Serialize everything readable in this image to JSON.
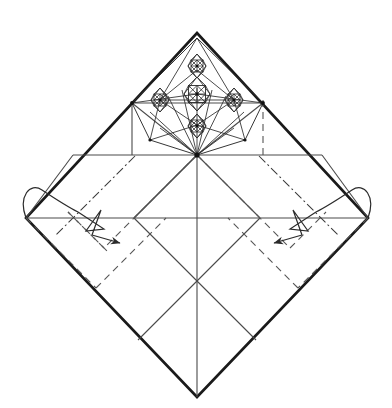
{
  "figure": {
    "kind": "origami-crease-pattern",
    "paper_shape": "square rotated 45 degrees (diamond)",
    "width": 392,
    "height": 408,
    "background_color": "#ffffff"
  },
  "colors": {
    "paper_edge": "#1a1a1a",
    "mountain_solid": "#4a4a4a",
    "valley_dashed": "#555555",
    "dash_dot": "#3a3a3a",
    "molecule_line": "#2b2b2b",
    "arrow": "#2b2b2b",
    "node_dot": "#111111"
  },
  "geometry": {
    "diamond": {
      "top": [
        197,
        33
      ],
      "right": [
        368,
        218
      ],
      "bottom": [
        197,
        397
      ],
      "left": [
        26,
        218
      ]
    },
    "center": [
      197,
      218
    ],
    "waist_line_y": 155,
    "waist_line_x1": 73,
    "waist_line_x2": 322,
    "mid_horizontal_y": 218,
    "vertical_centerline_x": 197,
    "left_vertical_solid_x": 132,
    "right_vertical_dashed_x": 263,
    "molecule_hub": [
      197,
      155
    ],
    "molecule_centers": [
      [
        197,
        94
      ],
      [
        160,
        100
      ],
      [
        234,
        100
      ],
      [
        197,
        70
      ],
      [
        197,
        125
      ]
    ]
  },
  "line_styles": {
    "edge": {
      "label": "Raw paper edge",
      "dash": "none",
      "width": 2.6
    },
    "mountain": {
      "label": "Existing crease / mountain",
      "dash": "none",
      "width": 1.1
    },
    "valley": {
      "label": "Valley fold",
      "dash": "7 5",
      "width": 1.1
    },
    "mountain_dashdot": {
      "label": "Mountain fold",
      "dash": "9 3 2 3",
      "width": 1.1
    },
    "molecule": {
      "label": "Molecule crease",
      "dash": "none",
      "width": 0.85
    }
  },
  "annotations": {
    "left_arrow": {
      "name": "crimp-fold-arrow-left",
      "description": "Crimp/pleat arrow with looped tail at left vertex pointing down-right",
      "tail": [
        30,
        200
      ],
      "head": [
        122,
        245
      ],
      "direction": "down-right"
    },
    "right_arrow": {
      "name": "crimp-fold-arrow-right",
      "description": "Crimp/pleat arrow with looped tail at right vertex pointing down-left",
      "tail": [
        364,
        200
      ],
      "head": [
        272,
        245
      ],
      "direction": "down-left"
    }
  },
  "labels": {
    "top_caption": "",
    "figure_number": ""
  }
}
